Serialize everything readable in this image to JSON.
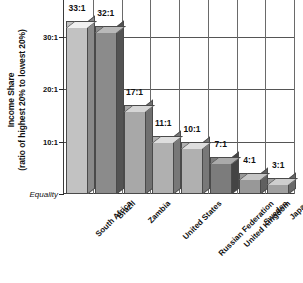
{
  "chart_data": {
    "type": "bar",
    "title": "",
    "subtitle": "",
    "xlabel": "",
    "ylabel_line1": "Income Share",
    "ylabel_line2": "(ratio of highest 20% to lowest 20%)",
    "categories": [
      "South Africa",
      "Brazil",
      "Zambia",
      "United States",
      "Russian Federation",
      "United Kingdom",
      "Sweden",
      "Japan"
    ],
    "values": [
      33,
      32,
      17,
      11,
      10,
      7,
      4,
      3
    ],
    "value_labels": [
      "33:1",
      "32:1",
      "17:1",
      "11:1",
      "10:1",
      "7:1",
      "4:1",
      "3:1"
    ],
    "bar_colors": [
      "#c2c2c2",
      "#8b8b8b",
      "#a8a8a8",
      "#b0b0b0",
      "#b0b0b0",
      "#7c7c7c",
      "#989898",
      "#a0a0a0"
    ],
    "ytick_values": [
      30,
      20,
      10,
      0
    ],
    "ytick_labels": [
      "30:1",
      "20:1",
      "10:1",
      "Equality"
    ],
    "ylim": [
      0,
      37
    ],
    "grid": "both",
    "legend": "none",
    "orientation": "vertical",
    "style": "3d-bars-grayscale"
  }
}
